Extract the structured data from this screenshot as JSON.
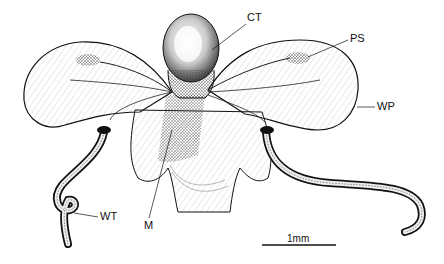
{
  "figure": {
    "labels": {
      "ct": "CT",
      "ps": "PS",
      "wp": "WP",
      "wt": "WT",
      "m": "M"
    },
    "scale_bar": {
      "label": "1mm"
    }
  },
  "colors": {
    "ink": "#111111",
    "background": "#ffffff",
    "stipple": "#555555"
  }
}
